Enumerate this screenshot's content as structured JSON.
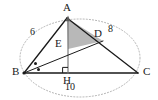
{
  "figure": {
    "kind": "geometry-diagram",
    "width": 158,
    "height": 100,
    "background_color": "#ffffff",
    "stroke_color": "#1a1a1a",
    "shade_color": "#b8b8b8",
    "dotted_color": "#a9a9a9"
  },
  "points": {
    "A": {
      "label": "A",
      "x": 67,
      "y": 18,
      "label_x": 63,
      "label_y": 3
    },
    "B": {
      "label": "B",
      "x": 24,
      "y": 73,
      "label_x": 12,
      "label_y": 67
    },
    "C": {
      "label": "C",
      "x": 138,
      "y": 73,
      "label_x": 143,
      "label_y": 67
    },
    "D": {
      "label": "D",
      "x": 103,
      "y": 41,
      "label_x": 94,
      "label_y": 29
    },
    "E": {
      "label": "E",
      "x": 68,
      "y": 49,
      "label_x": 55,
      "label_y": 39
    },
    "H": {
      "label": "H",
      "x": 68,
      "y": 73,
      "label_x": 63,
      "label_y": 76
    }
  },
  "segments": [
    {
      "name": "side-AB",
      "from": "A",
      "to": "B"
    },
    {
      "name": "side-AC",
      "from": "A",
      "to": "C"
    },
    {
      "name": "side-BC",
      "from": "B",
      "to": "C"
    },
    {
      "name": "altitude-AH",
      "from": "A",
      "to": "H"
    },
    {
      "name": "cevian-BD",
      "from": "B",
      "to": "D"
    }
  ],
  "shaded_region": {
    "name": "triangle-AED",
    "vertices": [
      "A",
      "E",
      "D"
    ],
    "fill": "#b8b8b8"
  },
  "length_labels": [
    {
      "name": "length-AB",
      "text": "6",
      "x": 33,
      "y": 32
    },
    {
      "name": "length-AC",
      "text": "8",
      "x": 110,
      "y": 29
    },
    {
      "name": "length-BC",
      "text": "10",
      "x": 69,
      "y": 87
    }
  ],
  "marks": {
    "right_angle_at_H": {
      "name": "right-angle-mark-H",
      "present": true
    },
    "equal_angle_dots_at_B": {
      "name": "angle-bisector-dots-B",
      "count": 2
    },
    "arrow_at_A": {
      "name": "altitude-arrowhead-A",
      "present": true
    }
  },
  "dotted_ellipse": {
    "name": "circumscribing-dotted-ellipse",
    "cx": 80,
    "cy": 58,
    "rx": 60,
    "ry": 39
  }
}
